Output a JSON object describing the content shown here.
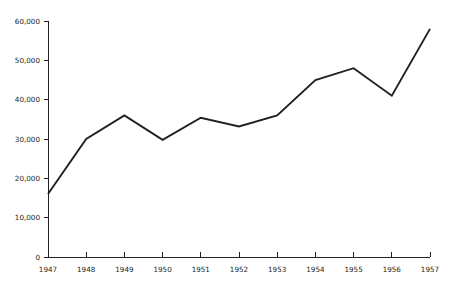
{
  "chart_data": {
    "type": "line",
    "title": "",
    "subtitle": "",
    "xlabel": "",
    "ylabel": "",
    "categories": [
      "1947",
      "1948",
      "1949",
      "1950",
      "1951",
      "1952",
      "1953",
      "1954",
      "1955",
      "1956",
      "1957"
    ],
    "x": [
      1947,
      1948,
      1949,
      1950,
      1951,
      1952,
      1953,
      1954,
      1955,
      1956,
      1957
    ],
    "values": [
      16000,
      30000,
      36000,
      29800,
      35400,
      33200,
      36000,
      45000,
      48000,
      41000,
      58000
    ],
    "series": [
      {
        "name": "",
        "values": [
          16000,
          30000,
          36000,
          29800,
          35400,
          33200,
          36000,
          45000,
          48000,
          41000,
          58000
        ]
      }
    ],
    "ylim": [
      0,
      60000
    ],
    "xlim": [
      1947,
      1957
    ],
    "yticks": [
      0,
      10000,
      20000,
      30000,
      40000,
      50000,
      60000
    ],
    "ytick_labels": [
      "0",
      "10,000",
      "20,000",
      "30,000",
      "40,000",
      "50,000",
      "60,000"
    ],
    "xtick_labels": [
      "1947",
      "1948",
      "1949",
      "1950",
      "1951",
      "1952",
      "1953",
      "1954",
      "1955",
      "1956",
      "1957"
    ],
    "grid": false,
    "legend": false,
    "legend_position": "none",
    "annotations": [],
    "line_color": "#231f20",
    "axis_color": "#231f20",
    "background_color": "#ffffff"
  }
}
